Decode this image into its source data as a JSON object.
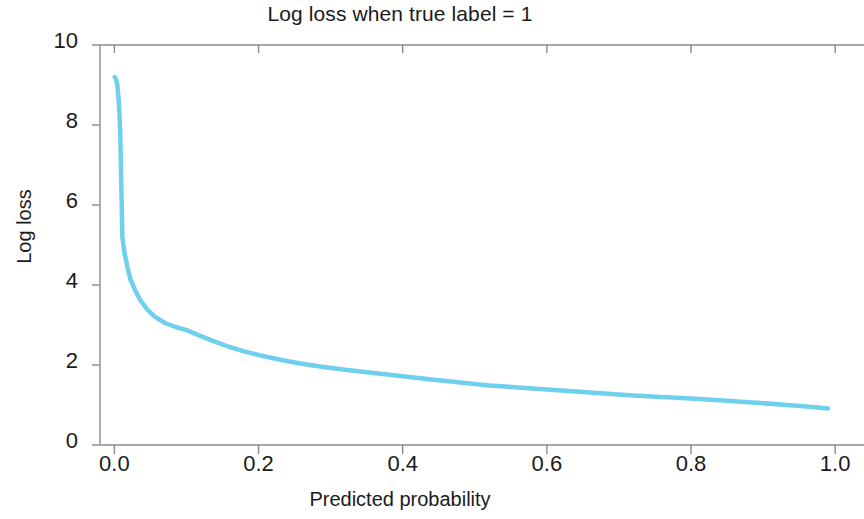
{
  "chart_data": {
    "type": "line",
    "title": "Log loss when true label = 1",
    "xlabel": "Predicted probability",
    "ylabel": "Log loss",
    "xlim": [
      -0.02,
      1.04
    ],
    "ylim": [
      0,
      10
    ],
    "xticks": [
      "0.0",
      "0.2",
      "0.4",
      "0.6",
      "0.8",
      "1.0"
    ],
    "xtick_values": [
      0.0,
      0.2,
      0.4,
      0.6,
      0.8,
      1.0
    ],
    "yticks": [
      "0",
      "2",
      "4",
      "6",
      "8",
      "10"
    ],
    "ytick_values": [
      0,
      2,
      4,
      6,
      8,
      10
    ],
    "grid": false,
    "legend": null,
    "line_color": "#6fd0ee",
    "line_width": 4.5,
    "series": [
      {
        "name": "log loss",
        "x": [
          0.0005,
          0.002,
          0.004,
          0.006,
          0.008,
          0.011,
          0.014,
          0.018,
          0.022,
          0.028,
          0.035,
          0.045,
          0.055,
          0.07,
          0.085,
          0.1,
          0.12,
          0.14,
          0.16,
          0.18,
          0.2,
          0.23,
          0.26,
          0.29,
          0.32,
          0.36,
          0.4,
          0.44,
          0.48,
          0.52,
          0.56,
          0.6,
          0.64,
          0.68,
          0.72,
          0.76,
          0.8,
          0.84,
          0.88,
          0.92,
          0.96,
          0.99
        ],
        "y": [
          9.2,
          9.15,
          9.0,
          8.6,
          7.9,
          5.2,
          4.8,
          4.45,
          4.15,
          3.9,
          3.65,
          3.4,
          3.22,
          3.05,
          2.95,
          2.87,
          2.72,
          2.58,
          2.45,
          2.34,
          2.25,
          2.13,
          2.03,
          1.95,
          1.88,
          1.8,
          1.72,
          1.64,
          1.56,
          1.49,
          1.44,
          1.39,
          1.34,
          1.29,
          1.24,
          1.2,
          1.16,
          1.12,
          1.07,
          1.02,
          0.96,
          0.91
        ]
      }
    ]
  },
  "figure": {
    "background_color": "#ffffff",
    "spine_color": "#8a8a8a",
    "text_color": "#1b1b1b"
  }
}
